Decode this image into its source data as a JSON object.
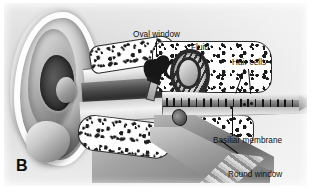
{
  "figure": {
    "panel_letter": "B",
    "style": "grayscale-airbrush-illustration"
  },
  "labels": [
    {
      "id": "oval_window",
      "text": "Oval window",
      "leader": "line-down"
    },
    {
      "id": "fluid",
      "text": "Fluid",
      "leader": "line-down"
    },
    {
      "id": "hair_cells",
      "text": "Hair cells",
      "leader": "two-lines-down"
    },
    {
      "id": "basiliar_membrane",
      "text": "Basiliar membrane",
      "leader": "line-up"
    },
    {
      "id": "round_window",
      "text": "Round window",
      "leader": "line-up-left"
    }
  ],
  "anatomy_parts": [
    "pinna",
    "ear-canal",
    "tympanic-membrane",
    "malleus",
    "incus",
    "stapes",
    "cochlea-coiled",
    "cochlea-uncoiled",
    "basilar-membrane",
    "hair-cells",
    "oval-window",
    "round-window",
    "temporal-bone"
  ],
  "colors": {
    "ink": "#111111",
    "plate_background": "#f2f2f2",
    "page_background": "#ffffff",
    "bone_fill": "#ffffff",
    "bone_speckle": "#1c1c1c"
  }
}
